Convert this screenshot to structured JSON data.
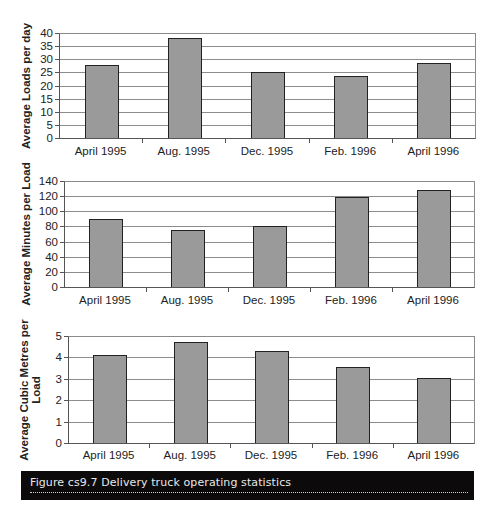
{
  "chart_data": [
    {
      "type": "bar",
      "title": "",
      "xlabel": "",
      "ylabel": "Average Loads per day",
      "categories": [
        "April 1995",
        "Aug. 1995",
        "Dec. 1995",
        "Feb. 1996",
        "April 1996"
      ],
      "values": [
        28,
        38,
        25,
        23.5,
        28.5
      ],
      "ylim": [
        0,
        40
      ],
      "yticks": [
        0,
        5,
        10,
        15,
        20,
        25,
        30,
        35,
        40
      ],
      "grid": true,
      "legend": null,
      "bar_color": "#9a9a9a"
    },
    {
      "type": "bar",
      "title": "",
      "xlabel": "",
      "ylabel": "Average Minutes per Load",
      "categories": [
        "April 1995",
        "Aug. 1995",
        "Dec. 1995",
        "Feb. 1996",
        "April 1996"
      ],
      "values": [
        90,
        75,
        80,
        119,
        128
      ],
      "ylim": [
        0,
        140
      ],
      "yticks": [
        0,
        20,
        40,
        60,
        80,
        100,
        120,
        140
      ],
      "grid": true,
      "legend": null,
      "bar_color": "#9a9a9a"
    },
    {
      "type": "bar",
      "title": "",
      "xlabel": "",
      "ylabel": "Average Cubic Metres per Load",
      "ylabel_lines": [
        "Average Cubic Metres per",
        "Load"
      ],
      "categories": [
        "April 1995",
        "Aug. 1995",
        "Dec. 1995",
        "Feb. 1996",
        "April 1996"
      ],
      "values": [
        4.1,
        4.7,
        4.3,
        3.55,
        3.05
      ],
      "ylim": [
        0,
        5
      ],
      "yticks": [
        0,
        1,
        2,
        3,
        4,
        5
      ],
      "grid": true,
      "legend": null,
      "bar_color": "#9a9a9a"
    }
  ],
  "caption": {
    "text": "Figure cs9.7  Delivery truck operating statistics"
  }
}
